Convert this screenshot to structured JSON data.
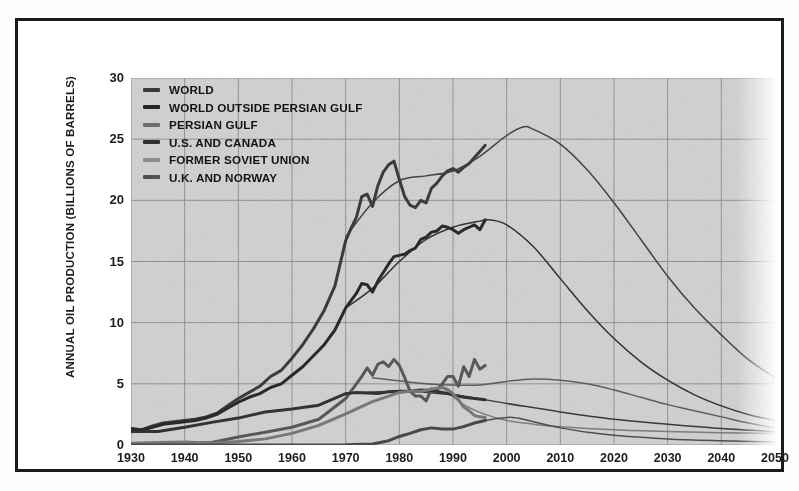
{
  "chart_data": {
    "type": "line",
    "title": "",
    "xlabel": "",
    "ylabel": "ANNUAL OIL PRODUCTION (BILLIONS OF BARRELS)",
    "xlim": [
      1930,
      2050
    ],
    "ylim": [
      0,
      30
    ],
    "xticks": [
      1930,
      1940,
      1950,
      1960,
      1970,
      1980,
      1990,
      2000,
      2010,
      2020,
      2030,
      2040,
      2050
    ],
    "yticks": [
      0,
      5,
      10,
      15,
      20,
      25,
      30
    ],
    "grid": true,
    "legend_position": "top-left",
    "background_color": "#d4d4d4",
    "gridline_color": "#8a8a8a",
    "frame_color": "#1b1b1b",
    "series": [
      {
        "name": "WORLD",
        "color": "#3c3c3c",
        "swatch_color": "#3a3a3a",
        "history": {
          "x": [
            1930,
            1932,
            1934,
            1936,
            1938,
            1940,
            1942,
            1944,
            1946,
            1948,
            1950,
            1952,
            1954,
            1956,
            1958,
            1960,
            1962,
            1964,
            1966,
            1968,
            1970,
            1971,
            1972,
            1973,
            1974,
            1975,
            1976,
            1977,
            1978,
            1979,
            1980,
            1981,
            1982,
            1983,
            1984,
            1985,
            1986,
            1987,
            1988,
            1989,
            1990,
            1991,
            1992,
            1993,
            1994,
            1995,
            1996
          ],
          "y": [
            1.35,
            1.25,
            1.55,
            1.8,
            1.9,
            2.0,
            2.1,
            2.3,
            2.6,
            3.2,
            3.8,
            4.3,
            4.8,
            5.6,
            6.1,
            7.1,
            8.2,
            9.5,
            11.0,
            13.0,
            16.7,
            17.7,
            18.6,
            20.3,
            20.5,
            19.5,
            21.2,
            22.3,
            22.9,
            23.2,
            21.7,
            20.3,
            19.6,
            19.4,
            20.0,
            19.8,
            21.0,
            21.4,
            22.0,
            22.4,
            22.6,
            22.3,
            22.7,
            23.0,
            23.5,
            24.0,
            24.5
          ]
        },
        "projection": {
          "x": [
            1970,
            1975,
            1980,
            1985,
            1990,
            1995,
            2000,
            2003,
            2005,
            2010,
            2015,
            2020,
            2025,
            2030,
            2035,
            2040,
            2045,
            2050
          ],
          "y": [
            17.0,
            19.8,
            21.6,
            22.0,
            22.4,
            23.6,
            25.3,
            26.0,
            25.8,
            24.6,
            22.5,
            19.8,
            16.8,
            13.8,
            11.2,
            9.0,
            7.0,
            5.5
          ]
        },
        "peak": {
          "year": 2003,
          "value": 26.0
        }
      },
      {
        "name": "WORLD OUTSIDE PERSIAN GULF",
        "color": "#2a2a2a",
        "swatch_color": "#262626",
        "history": {
          "x": [
            1930,
            1932,
            1934,
            1936,
            1938,
            1940,
            1942,
            1944,
            1946,
            1948,
            1950,
            1952,
            1954,
            1956,
            1958,
            1960,
            1962,
            1964,
            1966,
            1968,
            1970,
            1971,
            1972,
            1973,
            1974,
            1975,
            1976,
            1977,
            1978,
            1979,
            1980,
            1981,
            1982,
            1983,
            1984,
            1985,
            1986,
            1987,
            1988,
            1989,
            1990,
            1991,
            1992,
            1993,
            1994,
            1995,
            1996
          ],
          "y": [
            1.3,
            1.2,
            1.45,
            1.7,
            1.8,
            1.9,
            2.0,
            2.2,
            2.5,
            3.0,
            3.5,
            3.9,
            4.2,
            4.7,
            5.0,
            5.7,
            6.4,
            7.3,
            8.2,
            9.4,
            11.2,
            11.8,
            12.4,
            13.2,
            13.1,
            12.5,
            13.4,
            14.1,
            14.8,
            15.4,
            15.5,
            15.6,
            15.9,
            16.1,
            16.8,
            17.0,
            17.4,
            17.5,
            17.9,
            17.8,
            17.6,
            17.3,
            17.6,
            17.8,
            18.0,
            17.6,
            18.4
          ]
        },
        "projection": {
          "x": [
            1970,
            1975,
            1980,
            1985,
            1990,
            1995,
            1997,
            2000,
            2005,
            2010,
            2015,
            2020,
            2025,
            2030,
            2035,
            2040,
            2045,
            2050
          ],
          "y": [
            11.2,
            12.8,
            15.0,
            16.8,
            17.8,
            18.3,
            18.4,
            18.0,
            16.2,
            13.6,
            11.0,
            8.7,
            6.8,
            5.3,
            4.1,
            3.2,
            2.5,
            2.0
          ]
        },
        "peak": {
          "year": 1997,
          "value": 18.4
        }
      },
      {
        "name": "PERSIAN GULF",
        "color": "#5a5a5a",
        "swatch_color": "#6e6e6e",
        "history": {
          "x": [
            1930,
            1935,
            1940,
            1945,
            1950,
            1955,
            1960,
            1965,
            1970,
            1972,
            1973,
            1974,
            1975,
            1976,
            1977,
            1978,
            1979,
            1980,
            1981,
            1982,
            1983,
            1984,
            1985,
            1986,
            1987,
            1988,
            1989,
            1990,
            1991,
            1992,
            1993,
            1994,
            1995,
            1996
          ],
          "y": [
            0.05,
            0.08,
            0.12,
            0.2,
            0.65,
            1.05,
            1.45,
            2.1,
            3.8,
            5.0,
            5.6,
            6.3,
            5.7,
            6.6,
            6.8,
            6.4,
            7.0,
            6.5,
            5.5,
            4.4,
            4.0,
            4.0,
            3.6,
            4.6,
            4.5,
            5.0,
            5.6,
            5.6,
            4.8,
            6.4,
            5.6,
            7.0,
            6.2,
            6.5
          ]
        },
        "projection": {
          "x": [
            1975,
            1985,
            1990,
            1995,
            2000,
            2005,
            2010,
            2015,
            2020,
            2025,
            2030,
            2035,
            2040,
            2045,
            2050
          ],
          "y": [
            5.5,
            5.0,
            4.9,
            4.9,
            5.2,
            5.4,
            5.3,
            5.0,
            4.5,
            3.9,
            3.3,
            2.8,
            2.3,
            1.8,
            1.4
          ]
        },
        "peak": {
          "year": 1977,
          "value": 7.0
        }
      },
      {
        "name": "U.S. AND CANADA",
        "color": "#343434",
        "swatch_color": "#2f2f2f",
        "history": {
          "x": [
            1930,
            1935,
            1940,
            1945,
            1950,
            1955,
            1960,
            1965,
            1970,
            1972,
            1974,
            1976,
            1978,
            1980,
            1982,
            1984,
            1986,
            1988,
            1990,
            1992,
            1994,
            1996
          ],
          "y": [
            1.1,
            1.1,
            1.45,
            1.85,
            2.2,
            2.7,
            2.95,
            3.25,
            4.2,
            4.3,
            4.25,
            4.2,
            4.35,
            4.4,
            4.4,
            4.5,
            4.45,
            4.3,
            4.1,
            3.9,
            3.8,
            3.7
          ]
        },
        "projection": {
          "x": [
            1970,
            1980,
            1990,
            2000,
            2010,
            2020,
            2030,
            2040,
            2050
          ],
          "y": [
            4.2,
            4.4,
            4.1,
            3.4,
            2.7,
            2.1,
            1.7,
            1.35,
            1.1
          ]
        },
        "peak": {
          "year": 1984,
          "value": 4.5
        }
      },
      {
        "name": "FORMER SOVIET UNION",
        "color": "#7a7a7a",
        "swatch_color": "#8c8c8c",
        "history": {
          "x": [
            1930,
            1935,
            1940,
            1945,
            1950,
            1955,
            1960,
            1965,
            1970,
            1975,
            1978,
            1980,
            1982,
            1984,
            1986,
            1987,
            1988,
            1989,
            1990,
            1991,
            1992,
            1993,
            1994,
            1995,
            1996
          ],
          "y": [
            0.15,
            0.2,
            0.25,
            0.15,
            0.28,
            0.5,
            0.95,
            1.6,
            2.55,
            3.55,
            4.0,
            4.3,
            4.4,
            4.4,
            4.55,
            4.65,
            4.7,
            4.55,
            4.2,
            3.7,
            3.1,
            2.8,
            2.4,
            2.3,
            2.25
          ]
        },
        "projection": {
          "x": [
            1988,
            1992,
            1996,
            2000,
            2005,
            2010,
            2020,
            2030,
            2040,
            2050
          ],
          "y": [
            4.7,
            3.3,
            2.5,
            2.0,
            1.7,
            1.5,
            1.25,
            1.1,
            1.0,
            0.95
          ]
        },
        "peak": {
          "year": 1988,
          "value": 4.7
        }
      },
      {
        "name": "U.K. AND NORWAY",
        "color": "#4a4a4a",
        "swatch_color": "#4f4f4f",
        "history": {
          "x": [
            1930,
            1940,
            1950,
            1960,
            1970,
            1975,
            1978,
            1980,
            1982,
            1984,
            1986,
            1988,
            1990,
            1992,
            1994,
            1996
          ],
          "y": [
            0.0,
            0.0,
            0.0,
            0.0,
            0.02,
            0.08,
            0.35,
            0.7,
            0.95,
            1.25,
            1.4,
            1.3,
            1.3,
            1.5,
            1.8,
            2.0
          ]
        },
        "projection": {
          "x": [
            1990,
            1996,
            2000,
            2002,
            2005,
            2010,
            2015,
            2020,
            2030,
            2040,
            2050
          ],
          "y": [
            1.3,
            2.0,
            2.25,
            2.2,
            1.9,
            1.4,
            1.05,
            0.8,
            0.5,
            0.35,
            0.25
          ]
        },
        "peak": {
          "year": 2000,
          "value": 2.25
        }
      }
    ]
  },
  "legend": {
    "items": [
      {
        "label": "WORLD"
      },
      {
        "label": "WORLD OUTSIDE PERSIAN GULF"
      },
      {
        "label": "PERSIAN GULF"
      },
      {
        "label": "U.S. AND CANADA"
      },
      {
        "label": "FORMER SOVIET UNION"
      },
      {
        "label": "U.K. AND NORWAY"
      }
    ]
  }
}
